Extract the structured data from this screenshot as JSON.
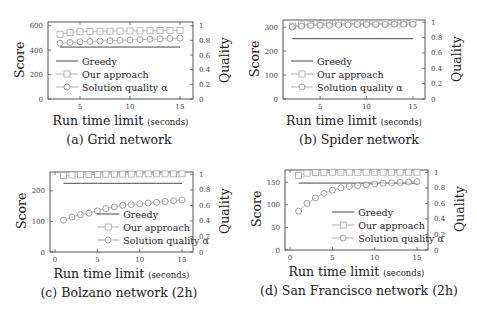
{
  "chart_data": [
    {
      "id": "a",
      "type": "line",
      "caption": "(a) Grid network",
      "xlabel": "Run time limit",
      "xlabel_unit": "(seconds)",
      "ylabel_left": "Score",
      "ylabel_right": "Quality",
      "xlim": [
        1.8,
        16.3
      ],
      "ylim_left": [
        0,
        630
      ],
      "ylim_right": [
        0,
        1.05
      ],
      "xticks": [
        5,
        10,
        15
      ],
      "yticks_left": [
        0,
        200,
        400,
        600
      ],
      "yticks_right": [
        0,
        0.2,
        0.4,
        0.6,
        0.8,
        1
      ],
      "legend": [
        "Greedy",
        "Our approach",
        "Solution quality α"
      ],
      "legend_position": "lower left",
      "x": [
        3,
        4,
        5,
        6,
        7,
        8,
        9,
        10,
        11,
        12,
        13,
        14,
        15
      ],
      "series": [
        {
          "name": "Greedy",
          "axis": "left",
          "style": "line",
          "values": [
            425,
            425,
            425,
            425,
            425,
            425,
            425,
            425,
            425,
            425,
            425,
            425,
            425
          ]
        },
        {
          "name": "Our approach",
          "axis": "left",
          "style": "square",
          "values": [
            530,
            545,
            550,
            552,
            554,
            555,
            556,
            557,
            558,
            559,
            560,
            560,
            561
          ]
        },
        {
          "name": "Solution quality α",
          "axis": "right",
          "style": "circle",
          "values": [
            0.76,
            0.77,
            0.78,
            0.785,
            0.79,
            0.795,
            0.8,
            0.805,
            0.81,
            0.815,
            0.82,
            0.825,
            0.83
          ]
        }
      ]
    },
    {
      "id": "b",
      "type": "line",
      "caption": "(b) Spider network",
      "xlabel": "Run time limit",
      "xlabel_unit": "(seconds)",
      "ylabel_left": "Score",
      "ylabel_right": "Quality",
      "xlim": [
        1.0,
        16.3
      ],
      "ylim_left": [
        0,
        330
      ],
      "ylim_right": [
        0,
        1.03
      ],
      "xticks": [
        5,
        10,
        15
      ],
      "yticks_left": [
        0,
        100,
        200,
        300
      ],
      "yticks_right": [
        0,
        0.2,
        0.4,
        0.6,
        0.8,
        1
      ],
      "legend": [
        "Greedy",
        "Our approach",
        "Solution quality α"
      ],
      "legend_position": "lower left",
      "x": [
        2,
        3,
        4,
        5,
        6,
        7,
        8,
        9,
        10,
        11,
        12,
        13,
        14,
        15
      ],
      "series": [
        {
          "name": "Greedy",
          "axis": "left",
          "style": "line",
          "values": [
            252,
            252,
            252,
            252,
            252,
            252,
            252,
            252,
            252,
            252,
            252,
            252,
            252,
            252
          ]
        },
        {
          "name": "Our approach",
          "axis": "left",
          "style": "square",
          "values": [
            305,
            310,
            312,
            313,
            314,
            315,
            315,
            316,
            316,
            316,
            317,
            317,
            317,
            318
          ]
        },
        {
          "name": "Solution quality α",
          "axis": "right",
          "style": "circle",
          "values": [
            0.94,
            0.95,
            0.955,
            0.96,
            0.96,
            0.965,
            0.965,
            0.97,
            0.97,
            0.97,
            0.97,
            0.975,
            0.975,
            0.975
          ]
        }
      ]
    },
    {
      "id": "c",
      "type": "line",
      "caption": "(c) Bolzano network (2h)",
      "xlabel": "Run time limit",
      "xlabel_unit": "(seconds)",
      "ylabel_left": "Score",
      "ylabel_right": "Quality",
      "xlim": [
        -0.6,
        16.3
      ],
      "ylim_left": [
        0,
        262
      ],
      "ylim_right": [
        0,
        1.03
      ],
      "xticks": [
        0,
        5,
        10,
        15
      ],
      "yticks_left": [
        0,
        100,
        200
      ],
      "yticks_right": [
        0,
        0.2,
        0.4,
        0.6,
        0.8,
        1
      ],
      "legend": [
        "Greedy",
        "Our approach",
        "Solution quality α"
      ],
      "legend_position": "lower right",
      "x": [
        1,
        2,
        3,
        4,
        5,
        6,
        7,
        8,
        9,
        10,
        11,
        12,
        13,
        14,
        15
      ],
      "series": [
        {
          "name": "Greedy",
          "axis": "left",
          "style": "line",
          "values": [
            225,
            225,
            225,
            225,
            225,
            225,
            225,
            225,
            225,
            225,
            225,
            225,
            225,
            225,
            225
          ]
        },
        {
          "name": "Our approach",
          "axis": "left",
          "style": "square",
          "values": [
            250,
            252,
            253,
            254,
            254,
            255,
            255,
            255,
            255,
            256,
            256,
            256,
            256,
            256,
            256
          ]
        },
        {
          "name": "Solution quality α",
          "axis": "right",
          "style": "circle",
          "values": [
            0.41,
            0.45,
            0.48,
            0.5,
            0.53,
            0.56,
            0.58,
            0.6,
            0.61,
            0.62,
            0.63,
            0.64,
            0.65,
            0.66,
            0.67
          ]
        }
      ]
    },
    {
      "id": "d",
      "type": "line",
      "caption": "(d) San Francisco network (2h)",
      "xlabel": "Run time limit",
      "xlabel_unit": "(seconds)",
      "ylabel_left": "Score",
      "ylabel_right": "Quality",
      "xlim": [
        -0.6,
        16.3
      ],
      "ylim_left": [
        0,
        177
      ],
      "ylim_right": [
        0,
        1.03
      ],
      "xticks": [
        0,
        5,
        10,
        15
      ],
      "yticks_left": [
        0,
        50,
        100,
        150
      ],
      "yticks_right": [
        0,
        0.2,
        0.4,
        0.6,
        0.8,
        1
      ],
      "legend": [
        "Greedy",
        "Our approach",
        "Solution quality α"
      ],
      "legend_position": "lower right",
      "x": [
        1,
        2,
        3,
        4,
        5,
        6,
        7,
        8,
        9,
        10,
        11,
        12,
        13,
        14,
        15
      ],
      "series": [
        {
          "name": "Greedy",
          "axis": "left",
          "style": "line",
          "values": [
            148,
            148,
            148,
            148,
            148,
            148,
            148,
            148,
            148,
            148,
            148,
            148,
            148,
            148,
            148
          ]
        },
        {
          "name": "Our approach",
          "axis": "left",
          "style": "square",
          "values": [
            165,
            170,
            171,
            171,
            172,
            172,
            172,
            172,
            172,
            172,
            172,
            172,
            172,
            172,
            172
          ]
        },
        {
          "name": "Solution quality α",
          "axis": "right",
          "style": "circle",
          "values": [
            0.5,
            0.6,
            0.67,
            0.73,
            0.77,
            0.8,
            0.82,
            0.83,
            0.84,
            0.85,
            0.86,
            0.865,
            0.87,
            0.875,
            0.88
          ]
        }
      ]
    }
  ],
  "layout": {
    "panels": [
      {
        "left": 0,
        "top": 0,
        "plot": {
          "x": 48,
          "y": 22,
          "w": 145,
          "h": 77
        }
      },
      {
        "left": 240,
        "top": 0,
        "plot": {
          "x": 43,
          "y": 20,
          "w": 142,
          "h": 79
        }
      },
      {
        "left": 0,
        "top": 160,
        "plot": {
          "x": 50,
          "y": 12,
          "w": 143,
          "h": 80
        }
      },
      {
        "left": 240,
        "top": 160,
        "plot": {
          "x": 45,
          "y": 10,
          "w": 143,
          "h": 80
        }
      }
    ]
  }
}
